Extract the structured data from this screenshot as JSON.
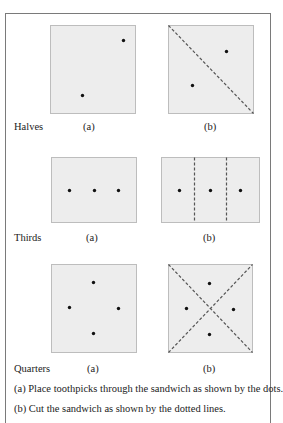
{
  "colors": {
    "frame_border": "#7a7a7a",
    "panel_fill": "#ededed",
    "panel_border": "#bdbdbd",
    "dot": "#111111",
    "dash": "#555555",
    "text": "#222222"
  },
  "rows": [
    {
      "name": "Halves",
      "label": "Halves",
      "a_label": "(a)",
      "b_label": "(b)",
      "a_panel": {
        "x": 50,
        "y": 25,
        "w": 85,
        "h": 88,
        "dots": [
          [
            73,
            15
          ],
          [
            32,
            70
          ]
        ],
        "lines": []
      },
      "b_panel": {
        "x": 168,
        "y": 25,
        "w": 85,
        "h": 88,
        "dots": [
          [
            58,
            26
          ],
          [
            24,
            60
          ]
        ],
        "lines": [
          [
            0,
            0,
            85,
            88
          ]
        ]
      }
    },
    {
      "name": "Thirds",
      "label": "Thirds",
      "a_label": "(a)",
      "b_label": "(b)",
      "a_panel": {
        "x": 51,
        "y": 157,
        "w": 85,
        "h": 65,
        "dots": [
          [
            18,
            33
          ],
          [
            43,
            33
          ],
          [
            67,
            33
          ]
        ],
        "lines": []
      },
      "b_panel": {
        "x": 161,
        "y": 157,
        "w": 98,
        "h": 65,
        "dots": [
          [
            18,
            33
          ],
          [
            49,
            33
          ],
          [
            79,
            33
          ]
        ],
        "lines": [
          [
            33,
            0,
            33,
            65
          ],
          [
            65,
            0,
            65,
            65
          ]
        ]
      }
    },
    {
      "name": "Quarters",
      "label": "Quarters",
      "a_label": "(a)",
      "b_label": "(b)",
      "a_panel": {
        "x": 51,
        "y": 264,
        "w": 85,
        "h": 88,
        "dots": [
          [
            42,
            18
          ],
          [
            18,
            43
          ],
          [
            67,
            44
          ],
          [
            42,
            69
          ]
        ],
        "lines": []
      },
      "b_panel": {
        "x": 168,
        "y": 264,
        "w": 84,
        "h": 88,
        "dots": [
          [
            41,
            19
          ],
          [
            18,
            44
          ],
          [
            65,
            45
          ],
          [
            41,
            70
          ]
        ],
        "lines": [
          [
            0,
            0,
            84,
            88
          ],
          [
            0,
            88,
            84,
            0
          ]
        ]
      }
    }
  ],
  "captions": [
    "(a)   Place toothpicks through the sandwich as shown by the dots.",
    "(b)  Cut the sandwich as shown by the dotted lines."
  ]
}
